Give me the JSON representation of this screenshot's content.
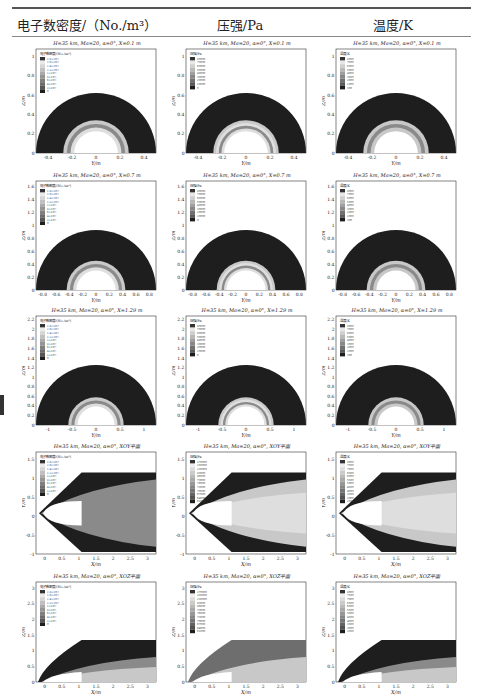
{
  "headers": [
    "电子数密度/（No./m³）",
    "压强/Pa",
    "温度/K"
  ],
  "rows": [
    {
      "title": "H=35 km, Ma=20, α=0°, X=0.1 m",
      "type": "yz",
      "r_outer": 0.55,
      "r_body": 0.2,
      "ymax": 1,
      "xticks": [
        "-0.4",
        "-0.2",
        "0",
        "0.2",
        "0.4"
      ],
      "yticks": [
        "0",
        "0.2",
        "0.4",
        "0.6",
        "0.8",
        "1"
      ],
      "xlabel": "Y/m",
      "ylabel": "Z/m"
    },
    {
      "title": "H=35 km, Ma=20, α=0°, X=0.7 m",
      "type": "yz",
      "r_outer": 0.92,
      "r_body": 0.3,
      "ymax": 1.7,
      "xticks": [
        "-0.8",
        "-0.6",
        "-0.4",
        "-0.2",
        "0",
        "0.2",
        "0.4",
        "0.6",
        "0.8"
      ],
      "yticks": [
        "0",
        "0.2",
        "0.4",
        "0.6",
        "0.8",
        "1",
        "1.2",
        "1.4",
        "1.6"
      ],
      "xlabel": "Y/m",
      "ylabel": "Z/m"
    },
    {
      "title": "H=35 km, Ma=20, α=0°, X=1.29 m",
      "type": "yz",
      "r_outer": 1.3,
      "r_body": 0.4,
      "ymax": 2.3,
      "xticks": [
        "-1",
        "-0.5",
        "0",
        "0.5",
        "1"
      ],
      "yticks": [
        "0",
        "0.2",
        "0.4",
        "0.6",
        "0.8",
        "1",
        "1.2",
        "1.4",
        "1.6",
        "1.8",
        "2",
        "2.2"
      ],
      "xlabel": "Y/m",
      "ylabel": "Z/m"
    },
    {
      "title": "H=35 km, Ma=20, α=0°, XOY平面",
      "type": "xoy",
      "xticks": [
        "0",
        "0.5",
        "1",
        "1.5",
        "2",
        "2.5",
        "3"
      ],
      "yticks": [
        "-1",
        "-0.5",
        "0",
        "0.5",
        "1",
        "1.5"
      ],
      "xlabel": "X/m",
      "ylabel": "Y/m"
    },
    {
      "title": "H=35 km, Ma=20, α=0°, XOZ平面",
      "type": "xoz",
      "xticks": [
        "0",
        "0.5",
        "1",
        "1.5",
        "2",
        "2.5",
        "3"
      ],
      "yticks": [
        "0",
        "0.5",
        "1",
        "1.5",
        "2",
        "2.5",
        "3"
      ],
      "xlabel": "X/m",
      "ylabel": "Z/m"
    }
  ],
  "legend_titles": [
    "电子数密度/(No./m³)",
    "压强/Pa",
    "温度/K"
  ],
  "legend_values": {
    "density": [
      "1.8×10²²",
      "1.6×10²²",
      "1.4×10²²",
      "1.2×10²²",
      "1×10²²",
      "8×10²¹",
      "6×10²¹",
      "4×10²¹",
      "2×10²¹",
      "0"
    ],
    "pressure": [
      "80000",
      "70000",
      "60000",
      "50000",
      "40000",
      "30000",
      "20000",
      "10000",
      "0"
    ],
    "temperature": [
      "8000",
      "7000",
      "6000",
      "5000",
      "4000",
      "3000",
      "2000",
      "1000",
      "300"
    ],
    "pressure_plane": [
      "270000",
      "250000",
      "230000",
      "89000",
      "86000",
      "79000",
      "76000",
      "73000",
      "70000",
      "67000",
      "64000",
      "61000",
      "300000"
    ],
    "temperature_plane": [
      "8000",
      "7500",
      "7000",
      "6500",
      "6000",
      "5500",
      "5000",
      "4500",
      "4000",
      "3500",
      "3000",
      "2500",
      "2000",
      "1500",
      "300"
    ]
  },
  "colors": {
    "dark": "#1e1e1e",
    "mid": "#8a8a8a",
    "light": "#c8c8c8",
    "lighter": "#dedede",
    "white": "#ffffff"
  }
}
